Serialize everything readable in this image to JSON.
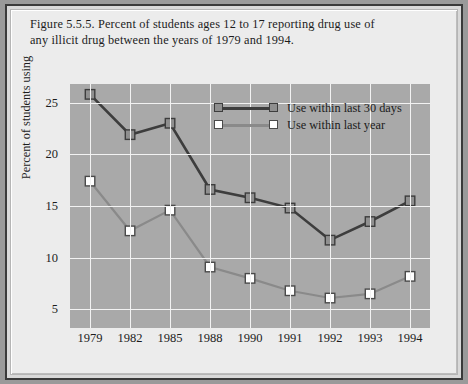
{
  "figure": {
    "title_line1": "Figure 5.5.5. Percent of students ages 12 to 17 reporting drug use of",
    "title_line2": "any illicit drug between the years of 1979 and 1994."
  },
  "legend": {
    "position": "inside-top-center",
    "entries": [
      {
        "label": "Use within last 30 days",
        "line_color": "#3d3d3d",
        "marker_fill": "#8f8f8f",
        "marker_stroke": "#3d3d3d"
      },
      {
        "label": "Use within last year",
        "line_color": "#8a8a8a",
        "marker_fill": "#ffffff",
        "marker_stroke": "#4a4a4a"
      }
    ]
  },
  "colors": {
    "plot_background": "#a9a9a9",
    "gridlines": "#f2f2f2",
    "page_background": "#ececec",
    "frame_border": "#3a3a3a",
    "text": "#1c1c1c"
  },
  "chart_data": {
    "type": "line",
    "title": "Figure 5.5.5. Percent of students ages 12 to 17 reporting drug use of any illicit drug between the years of 1979 and 1994.",
    "xlabel": "",
    "ylabel": "Percent of students using",
    "categories": [
      "1979",
      "1982",
      "1985",
      "1988",
      "1990",
      "1991",
      "1992",
      "1993",
      "1994"
    ],
    "ylim": [
      3.2,
      26.8
    ],
    "yticks": [
      5,
      10,
      15,
      20,
      25
    ],
    "ytick_labels": [
      "5",
      "10",
      "15",
      "20",
      "25"
    ],
    "grid": true,
    "grid_axis": "both",
    "legend_position": "inside-top-center",
    "series": [
      {
        "name": "Use within last 30 days",
        "values": [
          25.8,
          21.9,
          23.0,
          16.6,
          15.8,
          14.8,
          11.7,
          13.5,
          15.5
        ]
      },
      {
        "name": "Use within last year",
        "values": [
          17.4,
          12.6,
          14.6,
          9.1,
          8.0,
          6.8,
          6.1,
          6.5,
          8.2
        ]
      }
    ]
  }
}
